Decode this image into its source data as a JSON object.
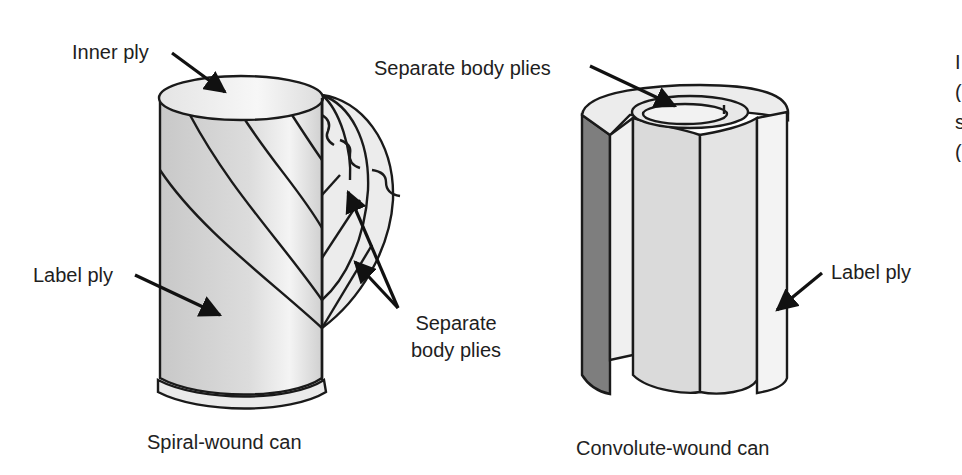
{
  "figure": {
    "left": {
      "caption": "Spiral-wound can",
      "labels": {
        "inner_ply": "Inner ply",
        "label_ply": "Label ply",
        "separate_body_plies_line1": "Separate",
        "separate_body_plies_line2": "body plies"
      }
    },
    "right": {
      "caption": "Convolute-wound can",
      "labels": {
        "separate_body_plies": "Separate body plies",
        "label_ply": "Label ply"
      }
    },
    "clipped_text_fragments": [
      "I",
      "(",
      "s",
      "("
    ]
  },
  "colors": {
    "stroke": "#1a1a1a",
    "light_fill": "#e6e6e6",
    "mid_fill": "#cfcfcf",
    "dark_fill": "#7a7a7a",
    "highlight": "#f4f4f4"
  }
}
